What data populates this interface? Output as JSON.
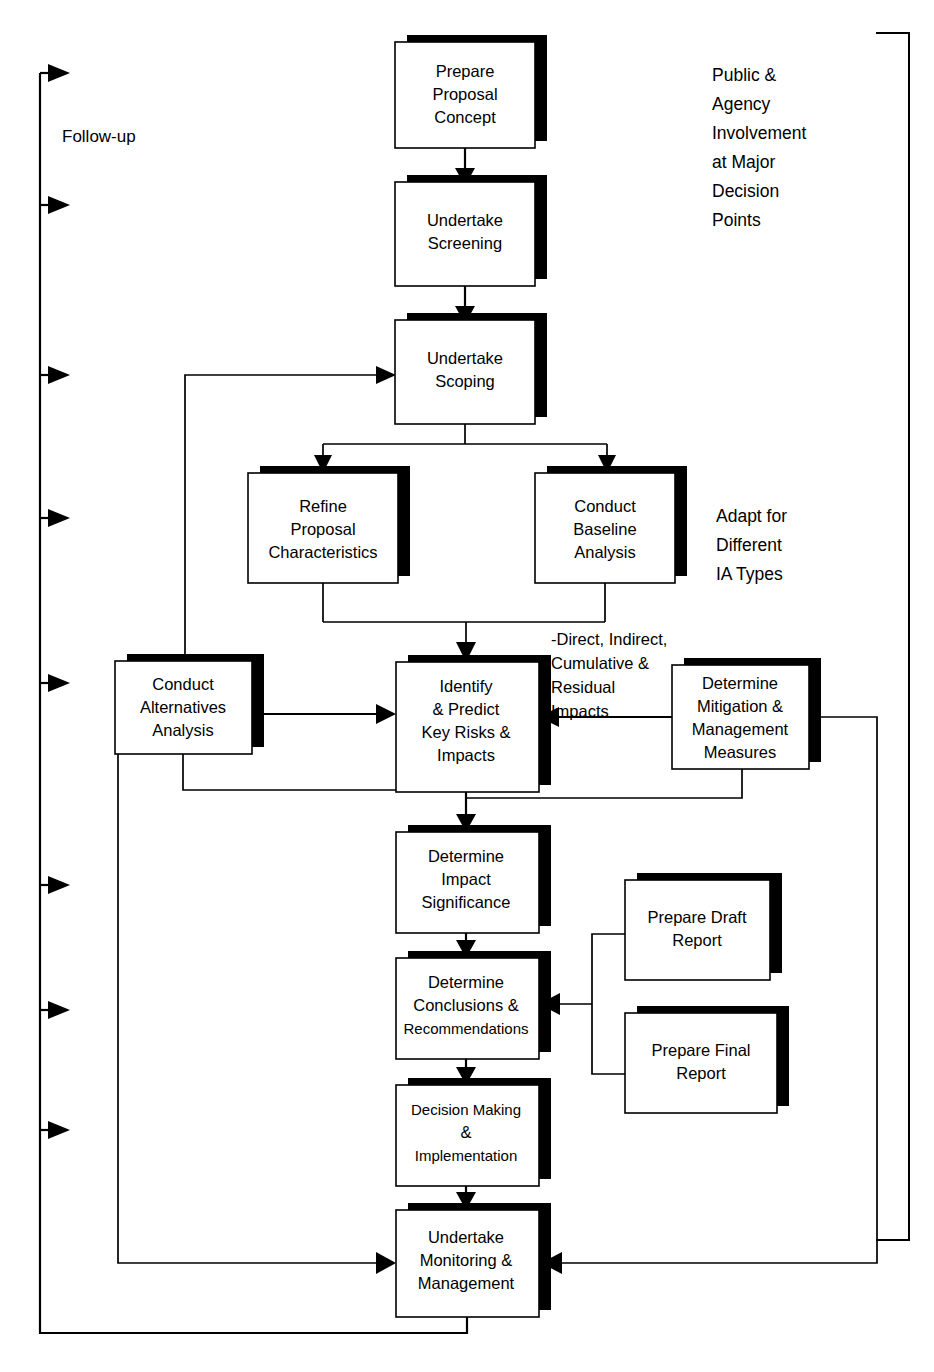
{
  "diagram": {
    "type": "flowchart",
    "colors": {
      "stroke": "#000000",
      "fill": "#ffffff",
      "shadow": "#000000",
      "background": "#ffffff"
    },
    "nodes": [
      {
        "id": "prepare-proposal-concept",
        "lines": [
          "Prepare",
          "Proposal",
          "Concept"
        ],
        "x": 395,
        "y": 42,
        "w": 140,
        "h": 106
      },
      {
        "id": "undertake-screening",
        "lines": [
          "Undertake",
          "Screening"
        ],
        "x": 395,
        "y": 182,
        "w": 140,
        "h": 104
      },
      {
        "id": "undertake-scoping",
        "lines": [
          "Undertake",
          "Scoping"
        ],
        "x": 395,
        "y": 320,
        "w": 140,
        "h": 104
      },
      {
        "id": "refine-proposal-characteristics",
        "lines": [
          "Refine",
          "Proposal",
          "Characteristics"
        ],
        "x": 248,
        "y": 473,
        "w": 150,
        "h": 110
      },
      {
        "id": "conduct-baseline-analysis",
        "lines": [
          "Conduct",
          "Baseline",
          "Analysis"
        ],
        "x": 535,
        "y": 473,
        "w": 140,
        "h": 110
      },
      {
        "id": "conduct-alternatives-analysis",
        "lines": [
          "Conduct",
          "Alternatives",
          "Analysis"
        ],
        "x": 115,
        "y": 661,
        "w": 137,
        "h": 93
      },
      {
        "id": "identify-predict-key-risks-impacts",
        "lines": [
          "Identify",
          "& Predict",
          "Key Risks &",
          "Impacts"
        ],
        "x": 396,
        "y": 662,
        "w": 143,
        "h": 130
      },
      {
        "id": "determine-mitigation-management-measures",
        "lines": [
          "Determine",
          "Mitigation &",
          "Management",
          "Measures"
        ],
        "x": 672,
        "y": 665,
        "w": 137,
        "h": 104
      },
      {
        "id": "determine-impact-significance",
        "lines": [
          "Determine",
          "Impact",
          "Significance"
        ],
        "x": 396,
        "y": 832,
        "w": 143,
        "h": 101
      },
      {
        "id": "prepare-draft-report",
        "lines": [
          "Prepare Draft",
          "Report"
        ],
        "x": 625,
        "y": 880,
        "w": 145,
        "h": 100
      },
      {
        "id": "determine-conclusions-recommendations",
        "lines": [
          "Determine",
          "Conclusions &",
          "Recommendations"
        ],
        "x": 396,
        "y": 958,
        "w": 143,
        "h": 101
      },
      {
        "id": "prepare-final-report",
        "lines": [
          "Prepare Final",
          "Report"
        ],
        "x": 625,
        "y": 1013,
        "w": 152,
        "h": 100
      },
      {
        "id": "decision-making-implementation",
        "lines": [
          "Decision Making",
          "&",
          "Implementation"
        ],
        "x": 396,
        "y": 1085,
        "w": 143,
        "h": 101
      },
      {
        "id": "undertake-monitoring-management",
        "lines": [
          "Undertake",
          "Monitoring &",
          "Management"
        ],
        "x": 396,
        "y": 1210,
        "w": 143,
        "h": 107
      }
    ],
    "annotations": [
      {
        "id": "follow-up-label",
        "lines": [
          "Follow-up"
        ],
        "x": 62,
        "y": 142,
        "size": 17
      },
      {
        "id": "public-agency-involvement-label",
        "lines": [
          "Public &",
          "Agency",
          "Involvement",
          "at Major",
          "Decision",
          "Points"
        ],
        "x": 712,
        "y": 81,
        "size": 17.5
      },
      {
        "id": "adapt-for-different-ia-types-label",
        "lines": [
          "Adapt for",
          "Different",
          "IA Types"
        ],
        "x": 716,
        "y": 522,
        "size": 17.5
      },
      {
        "id": "impact-types-label",
        "lines": [
          "-Direct, Indirect,",
          "Cumulative &",
          "Residual",
          "Impacts"
        ],
        "x": 551,
        "y": 645,
        "size": 16.5
      }
    ],
    "edges": [
      {
        "id": "concept-to-screening",
        "from": "prepare-proposal-concept",
        "to": "undertake-screening"
      },
      {
        "id": "screening-to-scoping",
        "from": "undertake-screening",
        "to": "undertake-scoping"
      },
      {
        "id": "scoping-to-refine",
        "from": "undertake-scoping",
        "to": "refine-proposal-characteristics"
      },
      {
        "id": "scoping-to-baseline",
        "from": "undertake-scoping",
        "to": "conduct-baseline-analysis"
      },
      {
        "id": "refine-baseline-to-identify",
        "from": "refine-proposal-characteristics",
        "to": "identify-predict-key-risks-impacts"
      },
      {
        "id": "alternatives-to-identify",
        "from": "conduct-alternatives-analysis",
        "to": "identify-predict-key-risks-impacts"
      },
      {
        "id": "mitigation-to-identify",
        "from": "determine-mitigation-management-measures",
        "to": "identify-predict-key-risks-impacts"
      },
      {
        "id": "alternatives-to-scoping-feedback",
        "from": "conduct-alternatives-analysis",
        "to": "undertake-scoping"
      },
      {
        "id": "alternatives-bottom-to-significance",
        "from": "conduct-alternatives-analysis",
        "to": "determine-impact-significance"
      },
      {
        "id": "mitigation-bottom-to-significance",
        "from": "determine-mitigation-management-measures",
        "to": "determine-impact-significance"
      },
      {
        "id": "identify-to-significance",
        "from": "identify-predict-key-risks-impacts",
        "to": "determine-impact-significance"
      },
      {
        "id": "significance-to-conclusions",
        "from": "determine-impact-significance",
        "to": "determine-conclusions-recommendations"
      },
      {
        "id": "draft-report-to-conclusions",
        "from": "prepare-draft-report",
        "to": "determine-conclusions-recommendations"
      },
      {
        "id": "final-report-to-conclusions",
        "from": "prepare-final-report",
        "to": "determine-conclusions-recommendations"
      },
      {
        "id": "conclusions-to-decision",
        "from": "determine-conclusions-recommendations",
        "to": "decision-making-implementation"
      },
      {
        "id": "decision-to-monitoring",
        "from": "decision-making-implementation",
        "to": "undertake-monitoring-management"
      },
      {
        "id": "alternatives-loop-to-monitoring",
        "from": "conduct-alternatives-analysis",
        "to": "undertake-monitoring-management"
      },
      {
        "id": "mitigation-loop-to-monitoring",
        "from": "determine-mitigation-management-measures",
        "to": "undertake-monitoring-management"
      },
      {
        "id": "monitoring-to-followup-spine",
        "from": "undertake-monitoring-management",
        "to": "follow-up-spine"
      }
    ],
    "followup_arrow_count": 8
  }
}
